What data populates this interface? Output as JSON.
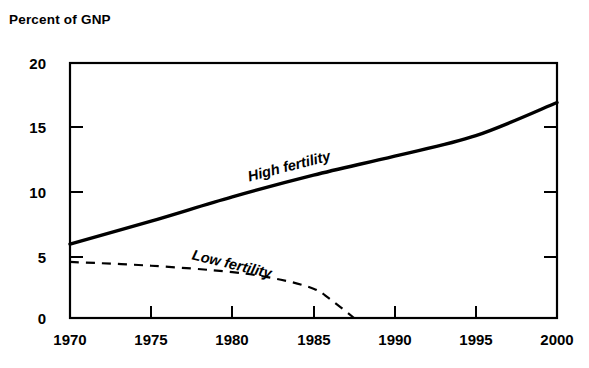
{
  "chart_data": {
    "type": "line",
    "title": "",
    "ylabel": "Percent of GNP",
    "xlabel": "",
    "xlim": [
      1970,
      2000
    ],
    "ylim": [
      0,
      20
    ],
    "grid": false,
    "legend_position": "inline-annotations",
    "x_ticks": [
      "1970",
      "1975",
      "1980",
      "1985",
      "1990",
      "1995",
      "2000"
    ],
    "y_ticks": [
      "0",
      "5",
      "10",
      "15",
      "20"
    ],
    "series": [
      {
        "name": "High fertility",
        "style": "solid",
        "color": "#000000",
        "x": [
          1970,
          1975,
          1980,
          1985,
          1990,
          1995,
          2000
        ],
        "values": [
          5.8,
          7.6,
          9.5,
          11.2,
          12.7,
          14.3,
          16.9
        ]
      },
      {
        "name": "Low fertility",
        "style": "dashed",
        "color": "#000000",
        "x": [
          1970,
          1975,
          1980,
          1983,
          1985,
          1986,
          1987.5
        ],
        "values": [
          4.4,
          4.1,
          3.6,
          3.0,
          2.3,
          1.5,
          0.0
        ]
      }
    ],
    "annotations": [
      {
        "text": "High fertility",
        "x": 1983.5,
        "y": 11.9,
        "rotation": -14.5
      },
      {
        "text": "Low fertility",
        "x": 1980.0,
        "y": 4.2,
        "rotation": 13.5
      }
    ]
  },
  "ticks": {
    "y": [
      {
        "label": "20",
        "value": 20
      },
      {
        "label": "15",
        "value": 15
      },
      {
        "label": "10",
        "value": 10
      },
      {
        "label": "5",
        "value": 5
      },
      {
        "label": "0",
        "value": 0
      }
    ],
    "x": [
      {
        "label": "1970",
        "value": 1970
      },
      {
        "label": "1975",
        "value": 1975
      },
      {
        "label": "1980",
        "value": 1980
      },
      {
        "label": "1985",
        "value": 1985
      },
      {
        "label": "1990",
        "value": 1990
      },
      {
        "label": "1995",
        "value": 1995
      },
      {
        "label": "2000",
        "value": 2000
      }
    ]
  },
  "colors": {
    "background": "#ffffff",
    "axis": "#000000",
    "ink": "#000000"
  }
}
